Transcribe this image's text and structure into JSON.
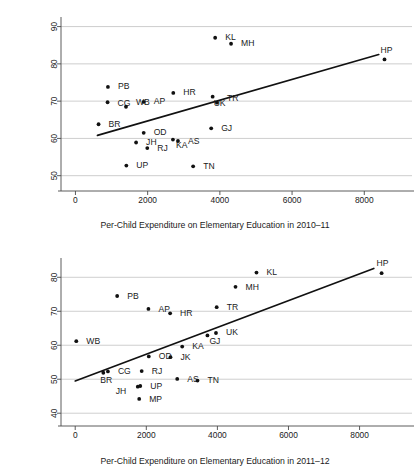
{
  "figure": {
    "type": "scatter-panel-figure",
    "panel_count": 2
  },
  "chart_data": [
    {
      "type": "scatter",
      "id": "chart-2010",
      "title": "",
      "xlabel": "Per-Child Expenditure on Elementary Education in 2010–11",
      "ylabel": "% Children (Std 3–5) who can read Level 1 (Std 1) text or more in 2010",
      "ylabel_line1": "% Children (Std 3–5) who can read Level 1",
      "ylabel_line2": "(Std 1) text or more in 2010",
      "xlim": [
        -400,
        9100
      ],
      "ylim": [
        47.5,
        91.5
      ],
      "xticks": [
        0,
        2000,
        4000,
        6000,
        8000
      ],
      "xticklabels": [
        "0",
        "2000",
        "4000",
        "6000",
        "8000"
      ],
      "yticks": [
        50,
        60,
        70,
        80,
        90
      ],
      "yticklabels": [
        "50",
        "60",
        "70",
        "80",
        "90"
      ],
      "grid": "horizontal",
      "legend": "none",
      "point_color": "#111111",
      "line_color": "#111111",
      "points": [
        {
          "label": "KL",
          "x": 3870,
          "y": 87.0,
          "lx": 10,
          "ly": 2.5
        },
        {
          "label": "MH",
          "x": 4310,
          "y": 85.4,
          "lx": 10,
          "ly": 2.5
        },
        {
          "label": "HP",
          "x": 8560,
          "y": 81.2,
          "lx": -4,
          "ly": -6.5
        },
        {
          "label": "PB",
          "x": 900,
          "y": 73.8,
          "lx": 10,
          "ly": 2.5
        },
        {
          "label": "HR",
          "x": 2710,
          "y": 72.2,
          "lx": 10,
          "ly": 2.5
        },
        {
          "label": "UK",
          "x": 3800,
          "y": 71.2,
          "lx": 1,
          "ly": 9.0
        },
        {
          "label": "CG",
          "x": 890,
          "y": 69.7,
          "lx": 10,
          "ly": 3.4
        },
        {
          "label": "AP",
          "x": 1890,
          "y": 69.8,
          "lx": 10,
          "ly": 2.5
        },
        {
          "label": "TR",
          "x": 3920,
          "y": 69.6,
          "lx": 10,
          "ly": -1.5
        },
        {
          "label": "WB",
          "x": 1400,
          "y": 68.5,
          "lx": 10,
          "ly": -1.8
        },
        {
          "label": "BR",
          "x": 640,
          "y": 63.8,
          "lx": 10,
          "ly": 2.5
        },
        {
          "label": "GJ",
          "x": 3760,
          "y": 62.7,
          "lx": 10,
          "ly": 2.5
        },
        {
          "label": "OD",
          "x": 1890,
          "y": 61.5,
          "lx": 10,
          "ly": 2.5
        },
        {
          "label": "KA",
          "x": 2700,
          "y": 59.7,
          "lx": 3,
          "ly": 8.8
        },
        {
          "label": "AS",
          "x": 2840,
          "y": 59.3,
          "lx": 10,
          "ly": 2.5
        },
        {
          "label": "JH",
          "x": 1680,
          "y": 58.9,
          "lx": 10,
          "ly": 2.5
        },
        {
          "label": "RJ",
          "x": 1990,
          "y": 57.4,
          "lx": 10,
          "ly": 2.5
        },
        {
          "label": "UP",
          "x": 1410,
          "y": 52.7,
          "lx": 10,
          "ly": 2.5
        },
        {
          "label": "TN",
          "x": 3260,
          "y": 52.5,
          "lx": 10,
          "ly": 2.5
        }
      ],
      "fit_line": {
        "x1": 610,
        "y1": 60.8,
        "x2": 8400,
        "y2": 82.5
      }
    },
    {
      "type": "scatter",
      "id": "chart-2011",
      "title": "",
      "xlabel": "Per-Child Expenditure on Elementary Education in 2011–12",
      "ylabel": "% Children (Std 3–5) who can read Level 1 (Std 1) text or more in 2011",
      "ylabel_line1": "% Children (Std 3–5) who can read Level 1",
      "ylabel_line2": "(Std 1) text or more in 2011",
      "xlim": [
        -400,
        9250
      ],
      "ylim": [
        38.0,
        84.5
      ],
      "xticks": [
        0,
        2000,
        4000,
        6000,
        8000
      ],
      "xticklabels": [
        "0",
        "2000",
        "4000",
        "6000",
        "8000"
      ],
      "yticks": [
        40,
        50,
        60,
        70,
        80
      ],
      "yticklabels": [
        "40",
        "50",
        "60",
        "70",
        "80"
      ],
      "grid": "horizontal",
      "legend": "none",
      "point_color": "#111111",
      "line_color": "#111111",
      "points": [
        {
          "label": "KL",
          "x": 5100,
          "y": 81.4,
          "lx": 10,
          "ly": 2.8
        },
        {
          "label": "HP",
          "x": 8620,
          "y": 81.2,
          "lx": -5,
          "ly": -7.0
        },
        {
          "label": "MH",
          "x": 4510,
          "y": 77.2,
          "lx": 10,
          "ly": 2.8
        },
        {
          "label": "PB",
          "x": 1180,
          "y": 74.5,
          "lx": 10,
          "ly": 2.8
        },
        {
          "label": "TR",
          "x": 3980,
          "y": 71.2,
          "lx": 10,
          "ly": 2.8
        },
        {
          "label": "AP",
          "x": 2060,
          "y": 70.7,
          "lx": 10,
          "ly": 2.8
        },
        {
          "label": "HR",
          "x": 2670,
          "y": 69.4,
          "lx": 10,
          "ly": 2.8
        },
        {
          "label": "UK",
          "x": 3960,
          "y": 63.6,
          "lx": 10,
          "ly": 2.0
        },
        {
          "label": "GJ",
          "x": 3720,
          "y": 62.9,
          "lx": 2,
          "ly": 9.0
        },
        {
          "label": "WB",
          "x": 30,
          "y": 61.2,
          "lx": 10,
          "ly": 3.0
        },
        {
          "label": "KA",
          "x": 3010,
          "y": 59.6,
          "lx": 10,
          "ly": 2.8
        },
        {
          "label": "OD",
          "x": 2070,
          "y": 56.7,
          "lx": 10,
          "ly": 2.8
        },
        {
          "label": "JK",
          "x": 2680,
          "y": 56.5,
          "lx": 10,
          "ly": 3.0
        },
        {
          "label": "RJ",
          "x": 1870,
          "y": 52.4,
          "lx": 10,
          "ly": 2.8
        },
        {
          "label": "CG",
          "x": 920,
          "y": 52.3,
          "lx": 10,
          "ly": 3.0
        },
        {
          "label": "BR",
          "x": 790,
          "y": 51.9,
          "lx": -3,
          "ly": 10.0
        },
        {
          "label": "AS",
          "x": 2870,
          "y": 50.1,
          "lx": 10,
          "ly": 2.8
        },
        {
          "label": "TN",
          "x": 3440,
          "y": 49.6,
          "lx": 10,
          "ly": 2.8
        },
        {
          "label": "UP",
          "x": 1830,
          "y": 48.0,
          "lx": 10,
          "ly": 3.0
        },
        {
          "label": "JH",
          "x": 1760,
          "y": 47.8,
          "lx": -22,
          "ly": 7.5
        },
        {
          "label": "MP",
          "x": 1800,
          "y": 44.2,
          "lx": 10,
          "ly": 2.8
        }
      ],
      "fit_line": {
        "x1": 0,
        "y1": 49.5,
        "x2": 8400,
        "y2": 82.6
      }
    }
  ]
}
